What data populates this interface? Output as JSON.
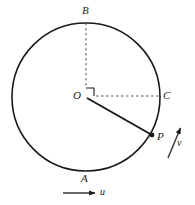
{
  "figure": {
    "type": "geometry-diagram",
    "background_color": "#ffffff",
    "stroke_color": "#1a1a1a",
    "dash_color": "#555555",
    "width": 195,
    "height": 205
  },
  "circle": {
    "center": {
      "x": 86,
      "y": 97
    },
    "radius": 74,
    "stroke_width": 1.6
  },
  "points": {
    "O": {
      "label": "O",
      "x": 86,
      "y": 97,
      "label_x": 74,
      "label_y": 92,
      "role": "center"
    },
    "A": {
      "label": "A",
      "x": 86,
      "y": 171,
      "label_x": 81,
      "label_y": 174,
      "role": "bottom-of-circle"
    },
    "B": {
      "label": "B",
      "x": 86,
      "y": 23,
      "label_x": 82,
      "label_y": 6,
      "role": "top-of-circle"
    },
    "C": {
      "label": "C",
      "x": 160,
      "y": 97,
      "label_x": 163,
      "label_y": 91,
      "role": "right-of-circle"
    },
    "P": {
      "label": "P",
      "x": 152,
      "y": 135,
      "label_x": 157,
      "label_y": 132,
      "role": "point-on-circle"
    }
  },
  "segments": {
    "radius_OP": {
      "from": "O",
      "to": "P",
      "style": "solid",
      "stroke_width": 2.0
    },
    "dashed_OB": {
      "from": "O",
      "to": "B",
      "style": "dashed"
    },
    "dashed_OC": {
      "from": "O",
      "to": "C",
      "style": "dashed"
    }
  },
  "right_angle_marker": {
    "at": "O",
    "between": [
      "OB",
      "OC"
    ],
    "size": 8
  },
  "vectors": [
    {
      "name": "u",
      "label": "u",
      "label_x": 100,
      "label_y": 188,
      "tail": {
        "x": 63,
        "y": 193
      },
      "head": {
        "x": 97,
        "y": 193
      },
      "direction": "horizontal-right",
      "description": "horizontal arrow below the circle"
    },
    {
      "name": "v",
      "label": "v",
      "label_x": 177,
      "label_y": 139,
      "tail": {
        "x": 168,
        "y": 158
      },
      "head": {
        "x": 182,
        "y": 124
      },
      "direction": "up-right",
      "description": "slanted arrow to the right of P"
    }
  ]
}
